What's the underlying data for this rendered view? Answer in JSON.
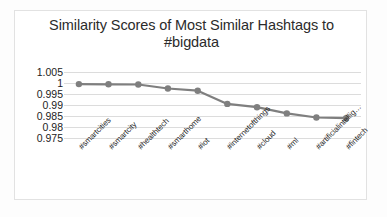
{
  "chart_data": {
    "type": "line",
    "title": "Similarity Scores of Most Similar Hashtags to #bigdata",
    "title_line1": "Similarity Scores of Most Similar Hashtags to",
    "title_line2": "#bigdata",
    "xlabel": "",
    "ylabel": "",
    "ylim": [
      0.975,
      1.005
    ],
    "ytick_labels": [
      "1.005",
      "1",
      "0.995",
      "0.99",
      "0.985",
      "0.98",
      "0.975"
    ],
    "ytick_values": [
      1.005,
      1,
      0.995,
      0.99,
      0.985,
      0.98,
      0.975
    ],
    "grid": true,
    "legend": false,
    "legend_position": "none",
    "categories": [
      "#smartcities",
      "#smartcity",
      "#healthtech",
      "#smarthome",
      "#iot",
      "#internetofthings",
      "#cloud",
      "#ml",
      "#artificialintellig…",
      "#fintech"
    ],
    "values": [
      0.9995,
      0.9994,
      0.9993,
      0.9975,
      0.9965,
      0.9905,
      0.989,
      0.9862,
      0.9843,
      0.984
    ],
    "series": [
      {
        "name": "similarity",
        "values": [
          0.9995,
          0.9994,
          0.9993,
          0.9975,
          0.9965,
          0.9905,
          0.989,
          0.9862,
          0.9843,
          0.984
        ],
        "color": "#7f7f7f",
        "marker": "circle"
      }
    ],
    "colors": {
      "line": "#7f7f7f",
      "marker": "#7f7f7f",
      "gridline": "#dcdcdc",
      "border": "#e2e2e2",
      "text": "#2b2b2b",
      "background": "#ffffff"
    }
  }
}
